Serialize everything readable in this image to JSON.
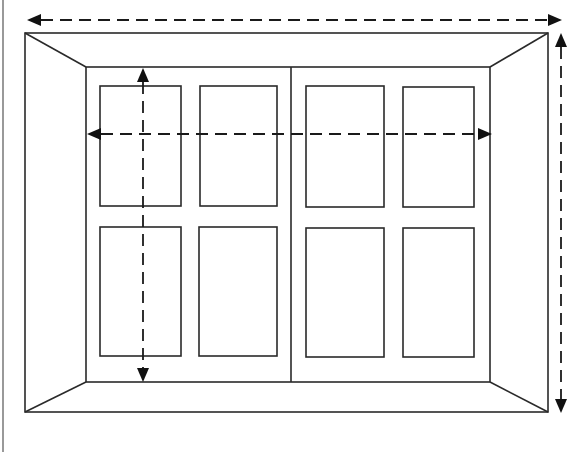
{
  "diagram": {
    "title": "",
    "colors": {
      "line": "#2a2a2a",
      "arrow": "#111111",
      "background": "#ffffff"
    },
    "page_edge": {
      "x": 3,
      "y1": 0,
      "y2": 452
    },
    "outer_frame": {
      "x1": 25,
      "y1": 33,
      "x2": 548,
      "y2": 412
    },
    "inner_frame": {
      "x1": 86,
      "y1": 67,
      "x2": 490,
      "y2": 382
    },
    "center_divider": {
      "x": 291,
      "y1": 67,
      "y2": 382
    },
    "panes": [
      {
        "x1": 100,
        "y1": 86,
        "x2": 181,
        "y2": 206
      },
      {
        "x1": 200,
        "y1": 86,
        "x2": 277,
        "y2": 206
      },
      {
        "x1": 306,
        "y1": 86,
        "x2": 384,
        "y2": 207
      },
      {
        "x1": 403,
        "y1": 87,
        "x2": 474,
        "y2": 207
      },
      {
        "x1": 100,
        "y1": 227,
        "x2": 181,
        "y2": 356
      },
      {
        "x1": 199,
        "y1": 227,
        "x2": 277,
        "y2": 356
      },
      {
        "x1": 306,
        "y1": 228,
        "x2": 384,
        "y2": 357
      },
      {
        "x1": 403,
        "y1": 228,
        "x2": 474,
        "y2": 357
      }
    ],
    "dimension_arrows": [
      {
        "name": "outer-width",
        "orientation": "horizontal",
        "x1": 27,
        "x2": 562,
        "y": 20
      },
      {
        "name": "outer-height",
        "orientation": "vertical",
        "x": 561,
        "y1": 33,
        "y2": 413
      },
      {
        "name": "inner-width",
        "orientation": "horizontal",
        "x1": 87,
        "x2": 492,
        "y": 134
      },
      {
        "name": "inner-height",
        "orientation": "vertical",
        "x": 143,
        "y1": 68,
        "y2": 382
      }
    ]
  }
}
